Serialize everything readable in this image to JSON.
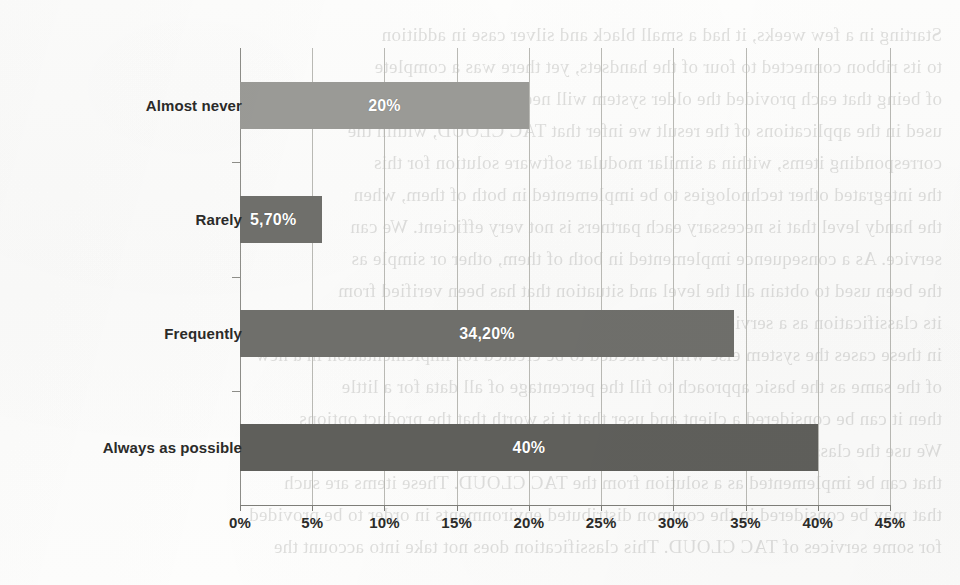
{
  "chart_data": {
    "type": "bar",
    "orientation": "horizontal",
    "title": "",
    "xlabel": "",
    "ylabel": "",
    "categories": [
      "Almost never",
      "Rarely",
      "Frequently",
      "Always as possible"
    ],
    "values": [
      20,
      5.7,
      34.2,
      40
    ],
    "value_labels": [
      "20%",
      "5,70%",
      "34,20%",
      "40%"
    ],
    "xlim": [
      0,
      45
    ],
    "xtick_values": [
      0,
      5,
      10,
      15,
      20,
      25,
      30,
      35,
      40,
      45
    ],
    "xtick_labels": [
      "0%",
      "5%",
      "10%",
      "15%",
      "20%",
      "25%",
      "30%",
      "35%",
      "40%",
      "45%"
    ],
    "grid": "vertical",
    "legend": "none",
    "bar_colors": [
      "#9a9a96",
      "#6f6f6b",
      "#6f6f6b",
      "#5f5f5b"
    ],
    "value_label_color": "#ffffff",
    "gridline_color": "#b9b9b4",
    "axis_color": "#7e7e79",
    "background_color": "#fdfdfc"
  },
  "bleed_through": {
    "lines": [
      "Starting in a few weeks, it had a small black and silver case in addition",
      "to its ribbon connected to four of the handsets, yet there was a complete",
      "of being that each provided the older system will need to be implemented",
      "used in the applications of the result we infer that TAC CLOUD, within the",
      "corresponding items, within a similar modular software solution for this",
      "the integrated other technologies to be implemented in both of them, when",
      "the handy level that is necessary each partners is not very efficient. We can",
      "service. As a consequence implemented in both of them, other or simple as",
      "the been used to obtain all the level and situation that has been verified from",
      "its classification as a service for the platform provider in the following that",
      "in these cases the system else will be needed to be created for implementation in a new",
      "of the same as the basic approach to fill the percentage of all data for a little",
      "then it can be considered a client and user that it is worth that the product options",
      "We use the classification we discussed above in the remaining of this paper",
      "that can be implemented as a solution from the TAC CLOUD. These items are such",
      "that may be considered in the common distributed environments in order to be provided",
      "for some services of TAC CLOUD. This classification does not take into account the"
    ]
  }
}
